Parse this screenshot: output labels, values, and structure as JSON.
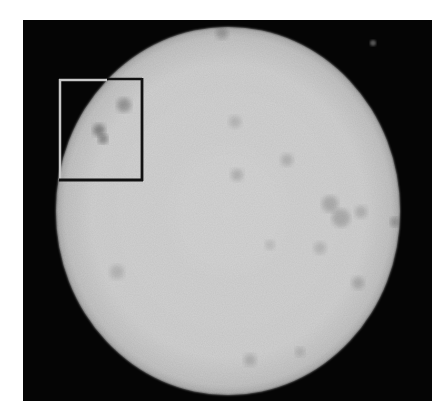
{
  "image": {
    "kind": "grayscale micrograph",
    "width": 448,
    "height": 418,
    "background_color": "#ffffff",
    "frame": {
      "x": 23,
      "y": 20,
      "width": 409,
      "height": 381,
      "color": "#050505"
    },
    "disc": {
      "cx": 228,
      "cy": 211,
      "rx": 172,
      "ry": 184,
      "center_color": "#d4d4d4",
      "edge_color": "#a9a9a9"
    },
    "inset_box": {
      "x": 59,
      "y": 79,
      "width": 83,
      "height": 101,
      "stroke_on_dark": "#c8c8c8",
      "stroke_on_light": "#111111"
    },
    "spots": [
      {
        "cx": 124,
        "cy": 105,
        "r": 7,
        "opacity": 0.55
      },
      {
        "cx": 99,
        "cy": 130,
        "r": 6,
        "opacity": 0.75
      },
      {
        "cx": 103,
        "cy": 139,
        "r": 5,
        "opacity": 0.7
      },
      {
        "cx": 235,
        "cy": 122,
        "r": 6,
        "opacity": 0.25
      },
      {
        "cx": 287,
        "cy": 160,
        "r": 6,
        "opacity": 0.3
      },
      {
        "cx": 237,
        "cy": 175,
        "r": 6,
        "opacity": 0.3
      },
      {
        "cx": 330,
        "cy": 204,
        "r": 8,
        "opacity": 0.35
      },
      {
        "cx": 341,
        "cy": 218,
        "r": 9,
        "opacity": 0.35
      },
      {
        "cx": 361,
        "cy": 212,
        "r": 6,
        "opacity": 0.3
      },
      {
        "cx": 358,
        "cy": 283,
        "r": 6,
        "opacity": 0.35
      },
      {
        "cx": 320,
        "cy": 248,
        "r": 6,
        "opacity": 0.25
      },
      {
        "cx": 117,
        "cy": 272,
        "r": 7,
        "opacity": 0.25
      },
      {
        "cx": 250,
        "cy": 360,
        "r": 6,
        "opacity": 0.3
      },
      {
        "cx": 300,
        "cy": 352,
        "r": 5,
        "opacity": 0.25
      },
      {
        "cx": 270,
        "cy": 245,
        "r": 5,
        "opacity": 0.2
      },
      {
        "cx": 395,
        "cy": 222,
        "r": 5,
        "opacity": 0.5
      },
      {
        "cx": 222,
        "cy": 33,
        "r": 6,
        "opacity": 0.45
      }
    ],
    "speck": {
      "cx": 373,
      "cy": 43,
      "r": 3,
      "color": "#555555"
    }
  }
}
